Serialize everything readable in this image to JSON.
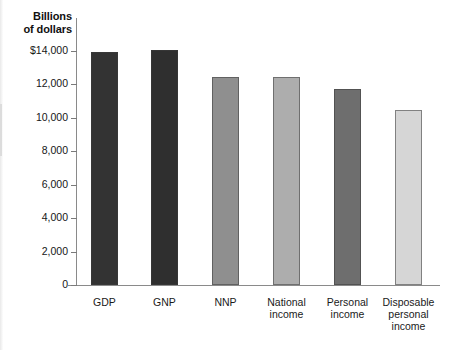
{
  "chart_data": {
    "type": "bar",
    "xlabel": "",
    "ylabel": "Billions of dollars",
    "categories": [
      "GDP",
      "GNP",
      "NNP",
      "National income",
      "Personal income",
      "Disposable personal income"
    ],
    "category_labels": [
      "GDP",
      "GNP",
      "NNP",
      "National\nincome",
      "Personal\nincome",
      "Disposable\npersonal\nincome"
    ],
    "values": [
      13950,
      14050,
      12450,
      12450,
      11750,
      10450
    ],
    "bar_colors": [
      "#333333",
      "#2f2f2f",
      "#8f8f8f",
      "#adadad",
      "#6e6e6e",
      "#d6d6d6"
    ],
    "ylim": [
      0,
      14000
    ],
    "ytick_values": [
      0,
      2000,
      4000,
      6000,
      8000,
      10000,
      12000,
      14000
    ],
    "ytick_labels": [
      "0",
      "2,000",
      "4,000",
      "6,000",
      "8,000",
      "10,000",
      "12,000",
      "$14,000"
    ],
    "grid": false,
    "legend": "none"
  },
  "axis": {
    "title_line1": "Billions",
    "title_line2": "of dollars"
  }
}
